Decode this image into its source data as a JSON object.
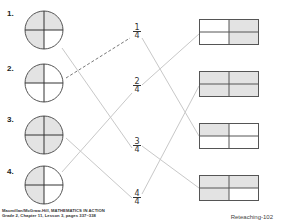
{
  "colors": {
    "shade": "#e3e3e3",
    "outline": "#555555",
    "connector": "#c8c8c8",
    "example_line": "#555555"
  },
  "items": [
    {
      "label": "1.",
      "circle_shaded": [
        "tl",
        "tr",
        "bl"
      ],
      "circle_fraction": "3/4"
    },
    {
      "label": "2.",
      "circle_shaded": [
        "tl"
      ],
      "circle_fraction": "1/4"
    },
    {
      "label": "3.",
      "circle_shaded": [
        "tl",
        "tr",
        "bl",
        "br"
      ],
      "circle_fraction": "4/4"
    },
    {
      "label": "4.",
      "circle_shaded": [
        "tl",
        "bl"
      ],
      "circle_fraction": "2/4"
    }
  ],
  "fractions": [
    {
      "numerator": "1",
      "denominator": "4"
    },
    {
      "numerator": "2",
      "denominator": "4"
    },
    {
      "numerator": "3",
      "denominator": "4"
    },
    {
      "numerator": "4",
      "denominator": "4"
    }
  ],
  "rectangles": [
    {
      "shaded": [
        "tr",
        "br"
      ],
      "fraction": "2/4"
    },
    {
      "shaded": [
        "tl",
        "tr",
        "bl",
        "br"
      ],
      "fraction": "4/4"
    },
    {
      "shaded": [
        "tl"
      ],
      "fraction": "1/4"
    },
    {
      "shaded": [
        "tl",
        "tr",
        "bl"
      ],
      "fraction": "3/4"
    }
  ],
  "connections": {
    "circle_to_fraction": [
      {
        "from": "1.",
        "to": "3/4",
        "style": "solid"
      },
      {
        "from": "2.",
        "to": "1/4",
        "style": "dashed"
      },
      {
        "from": "3.",
        "to": "4/4",
        "style": "solid"
      },
      {
        "from": "4.",
        "to": "2/4",
        "style": "solid"
      }
    ],
    "fraction_to_rectangle": [
      {
        "from": "1/4",
        "to_rect": 3
      },
      {
        "from": "2/4",
        "to_rect": 1
      },
      {
        "from": "3/4",
        "to_rect": 4
      },
      {
        "from": "4/4",
        "to_rect": 2
      }
    ]
  },
  "footer": {
    "publisher_line1": "Macmillan/McGraw-Hill, MATHEMATICS IN ACTION",
    "publisher_line2": "Grade 2, Chapter 11, Lesson 3, pages 337–338",
    "page_label": "Reteaching-102"
  }
}
